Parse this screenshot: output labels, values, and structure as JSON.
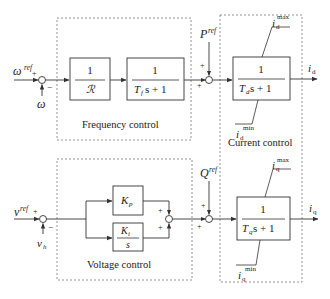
{
  "diagram": {
    "type": "control-block-diagram",
    "colors": {
      "line": "#333333",
      "dashed": "#777777",
      "text": "#1a1a1a",
      "background": "#ffffff"
    },
    "groups": {
      "frequency": {
        "label": "Frequency control"
      },
      "voltage": {
        "label": "Voltage control"
      },
      "current": {
        "label": "Current control"
      }
    },
    "inputs": {
      "omega_ref": {
        "base": "ω",
        "sup": "ref"
      },
      "omega": {
        "base": "ω"
      },
      "v_ref": {
        "base": "v",
        "sup": "ref"
      },
      "v_h": {
        "base": "v",
        "sub": "h"
      },
      "P_ref": {
        "base": "P",
        "sup": "ref"
      },
      "Q_ref": {
        "base": "Q",
        "sup": "ref"
      }
    },
    "outputs": {
      "i_d": {
        "base": "i",
        "sub": "d"
      },
      "i_q": {
        "base": "i",
        "sub": "q"
      }
    },
    "blocks": {
      "droop": {
        "num": "1",
        "den": "ℛ"
      },
      "freq_filter": {
        "num": "1",
        "den_T": "T",
        "den_sub": "f",
        "den_rest": "s + 1"
      },
      "kp": {
        "base": "K",
        "sub": "p"
      },
      "ki": {
        "num_base": "K",
        "num_sub": "i",
        "den": "s"
      },
      "current_d": {
        "num": "1",
        "den_T": "T",
        "den_sub": "d",
        "den_rest": "s + 1"
      },
      "current_q": {
        "num": "1",
        "den_T": "T",
        "den_sub": "q",
        "den_rest": "s + 1"
      }
    },
    "limits": {
      "id_max": {
        "base": "i",
        "sub": "d",
        "sup": "max"
      },
      "id_min": {
        "base": "i",
        "sub": "d",
        "sup": "min"
      },
      "iq_max": {
        "base": "i",
        "sub": "q",
        "sup": "max"
      },
      "iq_min": {
        "base": "i",
        "sub": "q",
        "sup": "min"
      }
    },
    "signs": {
      "plus": "+",
      "minus": "−"
    }
  }
}
